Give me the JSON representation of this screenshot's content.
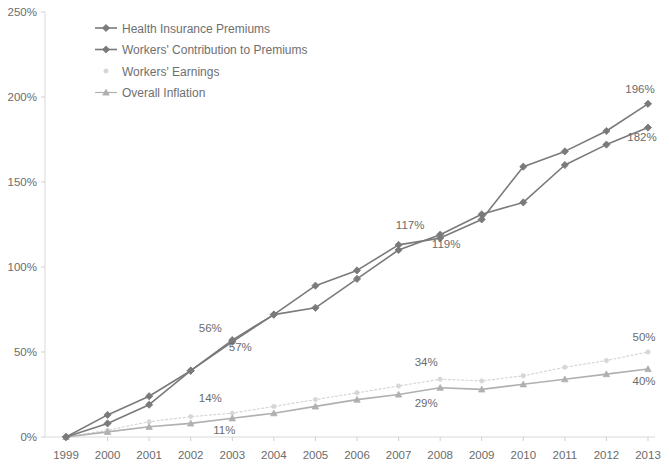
{
  "chart_data": {
    "type": "line",
    "title": "",
    "subtitle": "",
    "xlabel": "",
    "ylabel": "",
    "grid": false,
    "legend_position": "top-left-inside",
    "x": [
      1999,
      2000,
      2001,
      2002,
      2003,
      2004,
      2005,
      2006,
      2007,
      2008,
      2009,
      2010,
      2011,
      2012,
      2013
    ],
    "xtick_labels": [
      "1999",
      "2000",
      "2001",
      "2002",
      "2003",
      "2004",
      "2005",
      "2006",
      "2007",
      "2008",
      "2009",
      "2010",
      "2011",
      "2012",
      "2013"
    ],
    "ylim": [
      0,
      250
    ],
    "ytick_labels": [
      "0%",
      "50%",
      "100%",
      "150%",
      "200%",
      "250%"
    ],
    "ytick_values": [
      0,
      50,
      100,
      150,
      200,
      250
    ],
    "series": [
      {
        "name": "Health Insurance Premiums",
        "color": "#7a7a7a",
        "marker": "diamond",
        "style": "solid",
        "values": [
          0,
          8,
          19,
          39,
          56,
          72,
          76,
          93,
          110,
          119,
          131,
          138,
          160,
          172,
          182
        ]
      },
      {
        "name": "Workers' Contribution to Premiums",
        "color": "#7a7a7a",
        "marker": "diamond",
        "style": "solid",
        "values": [
          0,
          13,
          24,
          39,
          57,
          72,
          89,
          98,
          113,
          117,
          128,
          159,
          168,
          180,
          196
        ]
      },
      {
        "name": "Workers' Earnings",
        "color": "#d6d6d6",
        "marker": "dot",
        "style": "dotted",
        "values": [
          0,
          4,
          9,
          12,
          14,
          18,
          22,
          26,
          30,
          34,
          33,
          36,
          41,
          45,
          50
        ]
      },
      {
        "name": "Overall Inflation",
        "color": "#b0b0b0",
        "marker": "triangle",
        "style": "solid",
        "values": [
          0,
          3,
          6,
          8,
          11,
          14,
          18,
          22,
          25,
          29,
          28,
          31,
          34,
          37,
          40
        ]
      }
    ],
    "annotations": [
      {
        "label": "56%",
        "x": 2003,
        "value": 56,
        "series": "Health Insurance Premiums",
        "dx": -22,
        "dy": -10
      },
      {
        "label": "57%",
        "x": 2003,
        "value": 57,
        "series": "Workers' Contribution to Premiums",
        "dx": 8,
        "dy": 11
      },
      {
        "label": "14%",
        "x": 2003,
        "value": 14,
        "series": "Workers' Earnings",
        "dx": -22,
        "dy": -11
      },
      {
        "label": "11%",
        "x": 2003,
        "value": 11,
        "series": "Overall Inflation",
        "dx": -8,
        "dy": 16
      },
      {
        "label": "117%",
        "x": 2008,
        "value": 117,
        "series": "Workers' Contribution to Premiums",
        "dx": -30,
        "dy": -9
      },
      {
        "label": "119%",
        "x": 2008,
        "value": 119,
        "series": "Health Insurance Premiums",
        "dx": 6,
        "dy": 13
      },
      {
        "label": "34%",
        "x": 2008,
        "value": 34,
        "series": "Workers' Earnings",
        "dx": -14,
        "dy": -13
      },
      {
        "label": "29%",
        "x": 2008,
        "value": 29,
        "series": "Overall Inflation",
        "dx": -14,
        "dy": 19
      },
      {
        "label": "196%",
        "x": 2013,
        "value": 196,
        "series": "Workers' Contribution to Premiums",
        "dx": -8,
        "dy": -11
      },
      {
        "label": "182%",
        "x": 2013,
        "value": 182,
        "series": "Health Insurance Premiums",
        "dx": -6,
        "dy": 13
      },
      {
        "label": "50%",
        "x": 2013,
        "value": 50,
        "series": "Workers' Earnings",
        "dx": -4,
        "dy": -11
      },
      {
        "label": "40%",
        "x": 2013,
        "value": 40,
        "series": "Overall Inflation",
        "dx": -4,
        "dy": 16
      }
    ]
  },
  "legend": {
    "items": [
      {
        "label": "Health Insurance Premiums"
      },
      {
        "label": "Workers' Contribution to Premiums"
      },
      {
        "label": "Workers' Earnings"
      },
      {
        "label": "Overall Inflation"
      }
    ]
  },
  "axes": {
    "y_ticks": [
      "250%",
      "200%",
      "150%",
      "100%",
      "50%",
      "0%"
    ],
    "x_ticks": [
      "1999",
      "2000",
      "2001",
      "2002",
      "2003",
      "2004",
      "2005",
      "2006",
      "2007",
      "2008",
      "2009",
      "2010",
      "2011",
      "2012",
      "2013"
    ]
  }
}
